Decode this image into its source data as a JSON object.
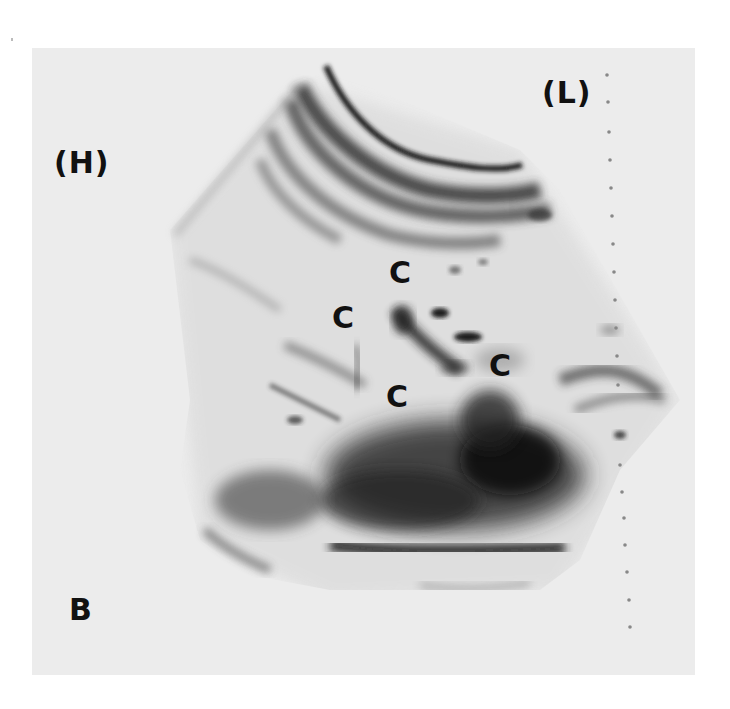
{
  "figure": {
    "type": "ultrasound scan (inverted grayscale print)",
    "panel_letter": "B",
    "orientation_labels": {
      "left": "(H)",
      "right": "(L)"
    },
    "structure_labels": [
      {
        "text": "C",
        "x": 389,
        "y": 258
      },
      {
        "text": "C",
        "x": 332,
        "y": 303
      },
      {
        "text": "C",
        "x": 489,
        "y": 351
      },
      {
        "text": "C",
        "x": 386,
        "y": 382
      }
    ],
    "depth_marker": {
      "style": "dotted line",
      "dot_count": 19
    },
    "colors": {
      "background": "#ffffff",
      "panel": "#ececec",
      "echo": "#1a1a1a",
      "label": "#111111"
    }
  }
}
